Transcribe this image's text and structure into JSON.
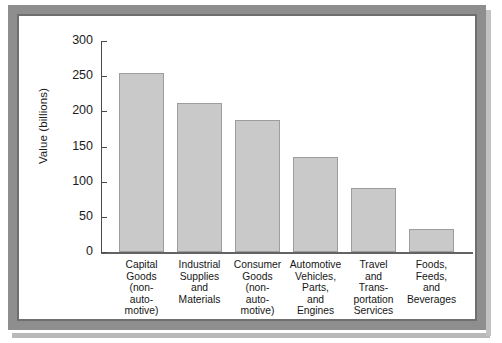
{
  "chart_data": {
    "type": "bar",
    "title": "",
    "xlabel": "",
    "ylabel": "Value (billions)",
    "ylim": [
      0,
      300
    ],
    "yticks": [
      0,
      50,
      100,
      150,
      200,
      250,
      300
    ],
    "grid": false,
    "legend": "none",
    "categories": [
      "Capital Goods (non-automotive)",
      "Industrial Supplies and Materials",
      "Consumer Goods (non-automotive)",
      "Automotive Vehicles, Parts, and Engines",
      "Travel and Transportation Services",
      "Foods, Feeds, and Beverages"
    ],
    "category_lines": [
      [
        "Capital",
        "Goods",
        "(non-",
        "auto-",
        "motive)"
      ],
      [
        "Industrial",
        "Supplies",
        "and",
        "Materials"
      ],
      [
        "Consumer",
        "Goods",
        "(non-",
        "auto-",
        "motive)"
      ],
      [
        "Automotive",
        "Vehicles,",
        "Parts,",
        "and",
        "Engines"
      ],
      [
        "Travel",
        "and",
        "Trans-",
        "portation",
        "Services"
      ],
      [
        "Foods,",
        "Feeds,",
        "and",
        "Beverages"
      ]
    ],
    "values": [
      254,
      212,
      188,
      135,
      91,
      33
    ],
    "bar_color": "#c9c9c9",
    "bar_border_color": "#9d9d9d",
    "axis_color": "#4a4a4a"
  },
  "frame": {
    "border_color": "#8e8e8e",
    "inner_border_color": "#6f6f6f"
  }
}
